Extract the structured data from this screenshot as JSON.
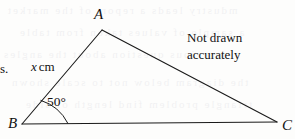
{
  "diagram": {
    "type": "triangle",
    "vertices": [
      {
        "name": "A",
        "label": "A",
        "x": 102,
        "y": 30
      },
      {
        "name": "B",
        "label": "B",
        "x": 22,
        "y": 124
      },
      {
        "name": "C",
        "label": "C",
        "x": 277,
        "y": 122
      }
    ],
    "sides": [
      {
        "name": "AB",
        "from": "B",
        "to": "A",
        "label": {
          "value": "x",
          "unit": "cm"
        }
      },
      {
        "name": "AC",
        "from": "A",
        "to": "C",
        "label": null
      },
      {
        "name": "BC",
        "from": "B",
        "to": "C",
        "label": null
      }
    ],
    "angles": [
      {
        "at": "B",
        "label": "50°",
        "value": 50,
        "unit": "degrees",
        "arc": true
      }
    ],
    "stroke_color": "#1a1a1a",
    "stroke_width": 1
  },
  "labels": {
    "vertex_a": "A",
    "vertex_b": "B",
    "vertex_c": "C",
    "angle_b": "50°",
    "side_ab_variable": "x",
    "side_ab_unit": "cm"
  },
  "note": {
    "line1": "Not drawn",
    "line2": "accurately"
  },
  "stray_text": {
    "fragment": "s."
  },
  "bleed_through": {
    "rows": [
      "mdustry leads a report of the market",
      "a sample of values taken from table",
      "previous question about the angles",
      "the diagram below not to scale shown",
      "triangle problem find length of side"
    ]
  }
}
